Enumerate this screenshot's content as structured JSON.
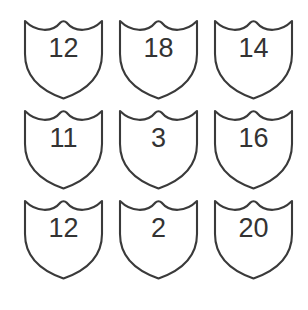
{
  "canvas": {
    "width": 308,
    "height": 310,
    "background_color": "#ffffff"
  },
  "style": {
    "shield_stroke_color": "#3a3a3a",
    "shield_fill_color": "#ffffff",
    "number_color": "#333333",
    "stroke_width": 2.1
  },
  "grid": {
    "rows": 3,
    "columns": 3,
    "cell_width": 83,
    "cell_height": 83,
    "column_pitch": 95,
    "row_pitch": 90
  },
  "shields": [
    {
      "id": "shield-r0-c0",
      "row": 0,
      "col": 0,
      "value": "12"
    },
    {
      "id": "shield-r0-c1",
      "row": 0,
      "col": 1,
      "value": "18"
    },
    {
      "id": "shield-r0-c2",
      "row": 0,
      "col": 2,
      "value": "14"
    },
    {
      "id": "shield-r1-c0",
      "row": 1,
      "col": 0,
      "value": "11"
    },
    {
      "id": "shield-r1-c1",
      "row": 1,
      "col": 1,
      "value": "3"
    },
    {
      "id": "shield-r1-c2",
      "row": 1,
      "col": 2,
      "value": "16"
    },
    {
      "id": "shield-r2-c0",
      "row": 2,
      "col": 0,
      "value": "12"
    },
    {
      "id": "shield-r2-c1",
      "row": 2,
      "col": 1,
      "value": "2"
    },
    {
      "id": "shield-r2-c2",
      "row": 2,
      "col": 2,
      "value": "20"
    }
  ]
}
